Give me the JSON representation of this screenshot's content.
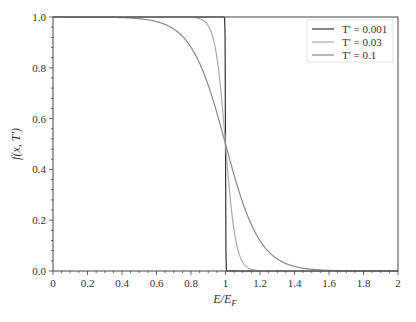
{
  "chart_data": {
    "type": "line",
    "title": "",
    "xlabel": "E/E_F",
    "ylabel": "f(x, T')",
    "xlim": [
      0,
      2
    ],
    "ylim": [
      0,
      1
    ],
    "grid": false,
    "legend_position": "upper right",
    "x_ticks": [
      "0",
      "0.2",
      "0.4",
      "0.6",
      "0.8",
      "1",
      "1.2",
      "1.4",
      "1.6",
      "1.8",
      "2"
    ],
    "y_ticks": [
      "0.0",
      "0.2",
      "0.4",
      "0.6",
      "0.8",
      "1.0"
    ],
    "function": "f(x,T') = 1 / (exp((x-1)/T') + 1)",
    "series": [
      {
        "name": "T' = 0.001",
        "T": 0.001,
        "color": "#333333",
        "x": [
          0,
          0.5,
          0.9,
          0.99,
          1.0,
          1.01,
          1.1,
          1.5,
          2.0
        ],
        "values": [
          1.0,
          1.0,
          1.0,
          1.0,
          0.5,
          0.0,
          0.0,
          0.0,
          0.0
        ]
      },
      {
        "name": "T' = 0.03",
        "T": 0.03,
        "color": "#aaaaaa",
        "x": [
          0,
          0.5,
          0.8,
          0.9,
          0.95,
          1.0,
          1.05,
          1.1,
          1.2,
          1.5,
          2.0
        ],
        "values": [
          1.0,
          1.0,
          1.0,
          0.97,
          0.84,
          0.5,
          0.16,
          0.03,
          0.001,
          0.0,
          0.0
        ]
      },
      {
        "name": "T' = 0.1",
        "T": 0.1,
        "color": "#888888",
        "x": [
          0,
          0.4,
          0.6,
          0.7,
          0.8,
          0.9,
          1.0,
          1.1,
          1.2,
          1.3,
          1.4,
          1.6,
          2.0
        ],
        "values": [
          1.0,
          0.998,
          0.982,
          0.953,
          0.881,
          0.731,
          0.5,
          0.269,
          0.119,
          0.047,
          0.018,
          0.002,
          0.0
        ]
      }
    ]
  },
  "labels": {
    "xlabel_main": "E/E",
    "xlabel_sub": "F",
    "ylabel": "f(x, T')",
    "legend": [
      "T' = 0.001",
      "T' = 0.03",
      "T' = 0.1"
    ]
  }
}
